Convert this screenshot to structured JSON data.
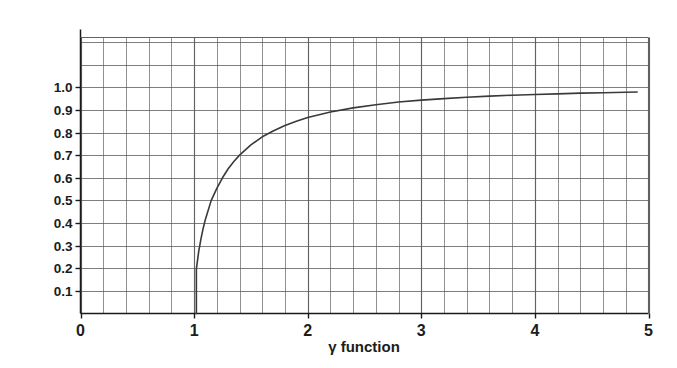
{
  "chart_data": {
    "type": "line",
    "title": "",
    "xlabel": "γ function",
    "ylabel": "velocity as a fraction of the speed of light",
    "xlim": [
      0,
      5
    ],
    "ylim": [
      0,
      1.22
    ],
    "grid": true,
    "legend": "none",
    "x_tick_labels": [
      "0",
      "1",
      "2",
      "3",
      "4",
      "5"
    ],
    "x_tick_values": [
      0,
      1,
      2,
      3,
      4,
      5
    ],
    "y_tick_labels": [
      "0.1",
      "0.2",
      "0.3",
      "0.4",
      "0.5",
      "0.6",
      "0.7",
      "0.8",
      "0.9",
      "1.0"
    ],
    "y_tick_values": [
      0.1,
      0.2,
      0.3,
      0.4,
      0.5,
      0.6,
      0.7,
      0.8,
      0.9,
      1.0
    ],
    "x_gridline_step": 0.2,
    "y_gridline_step": 0.1,
    "y_gridline_max": 1.2,
    "series": [
      {
        "name": "v/c versus gamma",
        "formula": "v/c = sqrt(1 - 1/gamma^2)",
        "x": [
          1.02,
          1.04,
          1.06,
          1.08,
          1.1,
          1.15,
          1.2,
          1.25,
          1.3,
          1.35,
          1.4,
          1.5,
          1.6,
          1.7,
          1.8,
          1.9,
          2.0,
          2.2,
          2.4,
          2.6,
          2.8,
          3.0,
          3.2,
          3.4,
          3.6,
          3.8,
          4.0,
          4.2,
          4.4,
          4.6,
          4.9
        ],
        "y": [
          0.196,
          0.272,
          0.329,
          0.377,
          0.417,
          0.499,
          0.553,
          0.6,
          0.64,
          0.672,
          0.7,
          0.745,
          0.781,
          0.808,
          0.831,
          0.85,
          0.866,
          0.891,
          0.909,
          0.923,
          0.935,
          0.943,
          0.95,
          0.956,
          0.961,
          0.965,
          0.968,
          0.971,
          0.974,
          0.976,
          0.979
        ]
      }
    ]
  },
  "axis": {
    "xlabel": "γ function",
    "ylabel": "velocity as a fraction of the speed of light"
  },
  "colors": {
    "grid": "#5a5a5a",
    "axis": "#1a1a1a",
    "curve": "#3a3a3a",
    "background": "#ffffff",
    "text": "#1c1c1c"
  }
}
